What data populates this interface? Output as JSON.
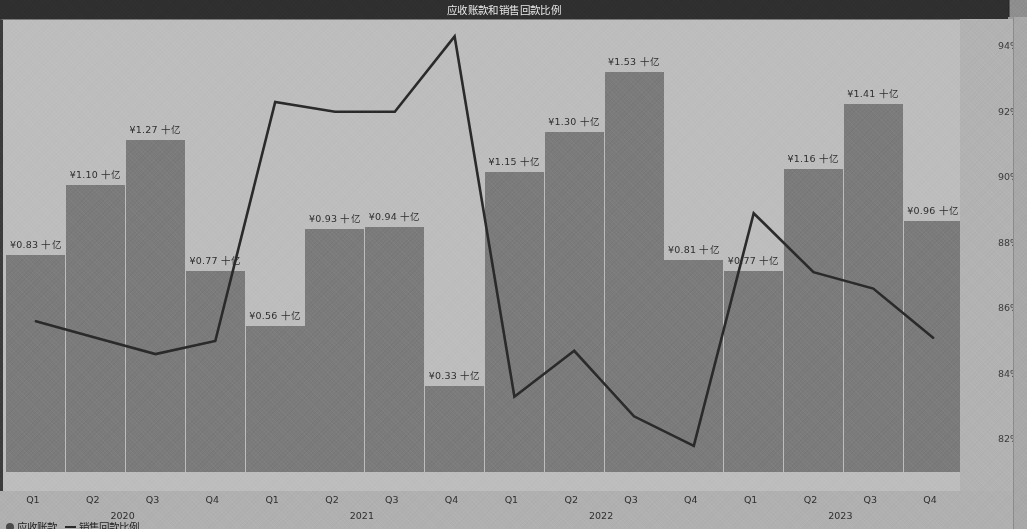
{
  "window": {
    "title": "应收账款和销售回款比例"
  },
  "legend": {
    "items": [
      {
        "marker": "dot",
        "label": "应收账款"
      },
      {
        "marker": "line",
        "label": "销售回款比例"
      }
    ]
  },
  "axes": {
    "right_ticks": [
      "94%",
      "92%",
      "90%",
      "88%",
      "86%",
      "84%",
      "82%"
    ],
    "x_group_labels": [
      "2020",
      "2021",
      "2022",
      "2023"
    ],
    "x_tick_labels": [
      "Q1",
      "Q2",
      "Q3",
      "Q4",
      "Q1",
      "Q2",
      "Q3",
      "Q4",
      "Q1",
      "Q2",
      "Q3",
      "Q4",
      "Q1",
      "Q2",
      "Q3",
      "Q4"
    ]
  },
  "chart_data": {
    "type": "bar",
    "title": "应收账款和销售回款比例",
    "xlabel": "",
    "ylabel": "",
    "y2label": "",
    "grid": false,
    "legend_position": "bottom-left",
    "categories": [
      "2020 Q1",
      "2020 Q2",
      "2020 Q3",
      "2020 Q4",
      "2021 Q1",
      "2021 Q2",
      "2021 Q3",
      "2021 Q4",
      "2022 Q1",
      "2022 Q2",
      "2022 Q3",
      "2022 Q4",
      "2023 Q1",
      "2023 Q2",
      "2023 Q3",
      "2023 Q4"
    ],
    "series": [
      {
        "name": "应收账款",
        "type": "bar",
        "unit": "十亿",
        "currency": "¥",
        "axis": "left",
        "values": [
          0.83,
          1.1,
          1.27,
          0.77,
          0.56,
          0.93,
          0.94,
          0.33,
          1.15,
          1.3,
          1.53,
          0.81,
          0.77,
          1.16,
          1.41,
          0.96
        ],
        "labels": [
          "¥0.83 十亿",
          "¥1.10 十亿",
          "¥1.27 十亿",
          "¥0.77 十亿",
          "¥0.56 十亿",
          "¥0.93 十亿",
          "¥0.94 十亿",
          "¥0.33 十亿",
          "¥1.15 十亿",
          "¥1.30 十亿",
          "¥1.53 十亿",
          "¥0.81 十亿",
          "¥0.77 十亿",
          "¥1.16 十亿",
          "¥1.41 十亿",
          "¥0.96 十亿"
        ]
      },
      {
        "name": "销售回款比例",
        "type": "line",
        "unit": "%",
        "axis": "right",
        "values": [
          85.6,
          85.1,
          84.6,
          85.0,
          92.3,
          92.0,
          92.0,
          94.3,
          83.3,
          84.7,
          82.7,
          81.8,
          88.9,
          87.1,
          86.6,
          85.1
        ]
      }
    ],
    "ylim": [
      0,
      1.7
    ],
    "y2lim": [
      81.0,
      94.8
    ]
  },
  "style": {
    "bar_color": "#7b7b7b",
    "line_color": "#2a2a2a",
    "panel_bg": "#bdbdbd",
    "title_bar_bg": "#2f2f2f",
    "title_text_color": "#e8e8e8"
  }
}
